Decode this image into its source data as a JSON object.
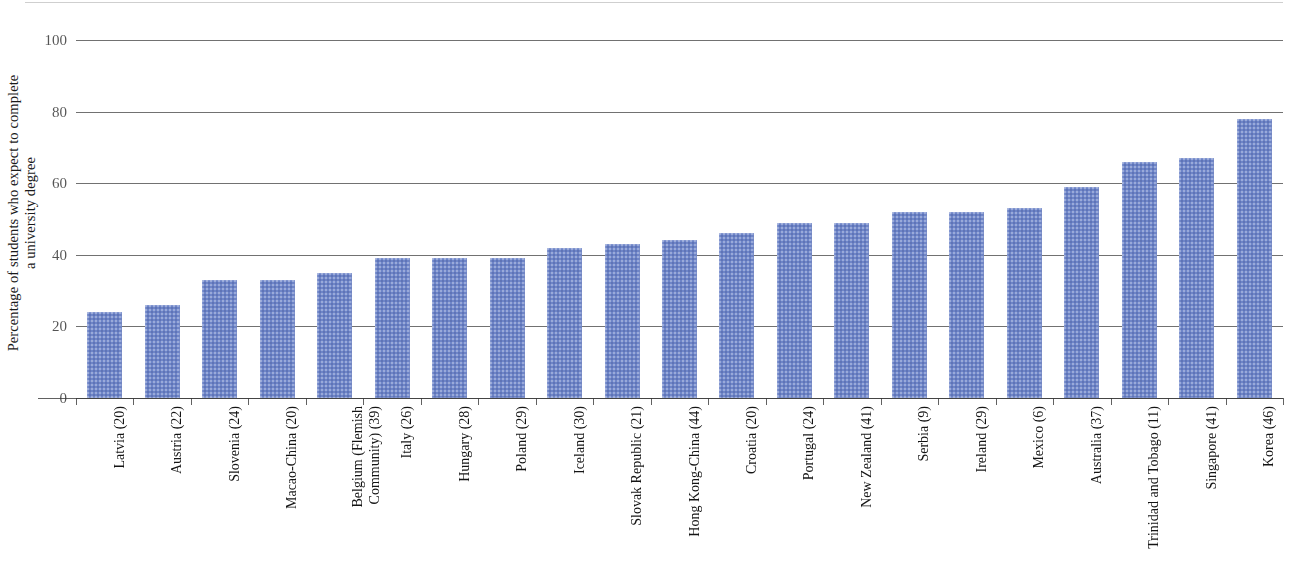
{
  "chart_data": {
    "type": "bar",
    "title": "",
    "xlabel": "",
    "ylabel_line1": "Percentage of students who expect to complete",
    "ylabel_line2": "a university degree",
    "ylim": [
      0,
      100
    ],
    "ytick_labels": [
      "100",
      "80",
      "60",
      "40",
      "20",
      "0"
    ],
    "yticks": [
      100,
      80,
      60,
      40,
      20,
      0
    ],
    "grid": true,
    "legend": "none",
    "bar_color": "#6e85c8",
    "categories": [
      "Latvia (20)",
      "Austria (22)",
      "Slovenia (24)",
      "Macao-China (20)",
      "Belgium (Flemish Community) (39)",
      "Italy (26)",
      "Hungary (28)",
      "Poland (29)",
      "Iceland (30)",
      "Slovak Republic (21)",
      "Hong Kong-China (44)",
      "Croatia (20)",
      "Portugal (24)",
      "New Zealand (41)",
      "Serbia (9)",
      "Ireland (29)",
      "Mexico (6)",
      "Australia (37)",
      "Trinidad and Tobago (11)",
      "Singapore (41)",
      "Korea (46)"
    ],
    "values": [
      24,
      26,
      33,
      33,
      35,
      39,
      39,
      39,
      42,
      43,
      44,
      46,
      49,
      49,
      52,
      52,
      53,
      59,
      66,
      67,
      78
    ]
  }
}
